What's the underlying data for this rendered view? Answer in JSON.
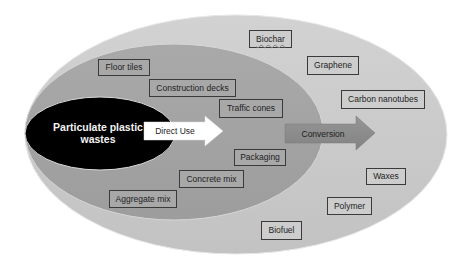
{
  "diagram": {
    "core": {
      "line1": "Particulate plastic",
      "line2": "wastes",
      "color": "#000000"
    },
    "arrows": {
      "direct_use": {
        "label": "Direct Use",
        "color": "#ffffff"
      },
      "conversion": {
        "label": "Conversion",
        "color": "#8c8c8c"
      }
    },
    "rings": {
      "inner_color": "#a3a3a3",
      "outer_color": "#cbcbcb"
    },
    "direct_use_items": [
      {
        "label": "Floor tiles"
      },
      {
        "label": "Construction decks"
      },
      {
        "label": "Traffic cones"
      },
      {
        "label": "Packaging"
      },
      {
        "label": "Concrete mix"
      },
      {
        "label": "Aggregate mix"
      }
    ],
    "conversion_items": [
      {
        "label": "Biochar"
      },
      {
        "label": "Graphene"
      },
      {
        "label": "Carbon nanotubes"
      },
      {
        "label": "Waxes"
      },
      {
        "label": "Polymer"
      },
      {
        "label": "Biofuel"
      }
    ]
  }
}
